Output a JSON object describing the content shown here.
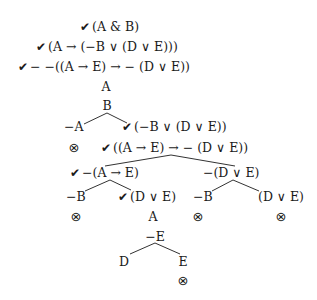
{
  "check_symbol": "✔",
  "closed_symbol": "⊗",
  "nodes": {
    "p1": "(A & B)",
    "p2": "(A → (−B ∨ (D ∨ E)))",
    "p3": "− −((A → E) → − (D ∨ E))",
    "a1": "A",
    "b1": "B",
    "negA": "−A",
    "disj1": "(−B ∨ (D ∨ E))",
    "cond1": "((A → E) → − (D ∨ E))",
    "negAE": "−(A → E)",
    "negDE": "−(D ∨ E)",
    "negB_left": "−B",
    "DE_left": "(D ∨ E)",
    "negB_right": "−B",
    "DE_right": "(D ∨ E)",
    "a2": "A",
    "negE": "−E",
    "d1": "D",
    "e1": "E"
  },
  "branches_closed": 5
}
